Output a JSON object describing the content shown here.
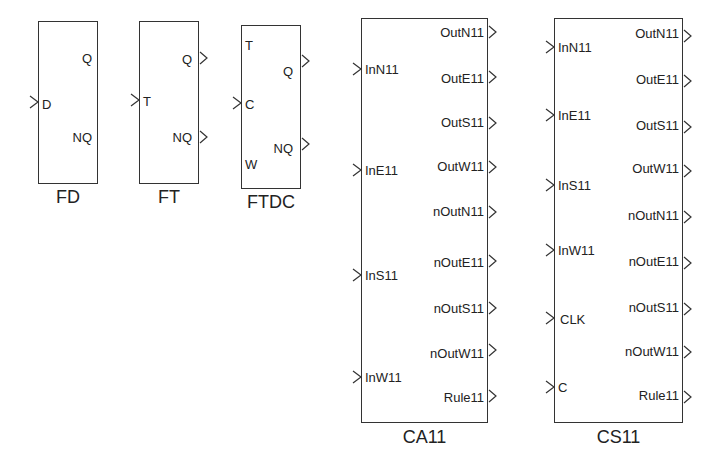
{
  "blocks": {
    "fd": {
      "name": "FD",
      "inputs": [
        {
          "label": "D",
          "arrow": true
        }
      ],
      "outputs": [
        {
          "label": "Q",
          "arrow": false
        },
        {
          "label": "NQ",
          "arrow": false
        }
      ]
    },
    "ft": {
      "name": "FT",
      "inputs": [
        {
          "label": "T",
          "arrow": true
        }
      ],
      "outputs": [
        {
          "label": "Q",
          "arrow": true
        },
        {
          "label": "NQ",
          "arrow": true
        }
      ]
    },
    "ftdc": {
      "name": "FTDC",
      "inputs": [
        {
          "label": "T",
          "arrow": false
        },
        {
          "label": "C",
          "arrow": true
        },
        {
          "label": "W",
          "arrow": false
        }
      ],
      "outputs": [
        {
          "label": "Q",
          "arrow": true
        },
        {
          "label": "NQ",
          "arrow": true
        }
      ]
    },
    "ca11": {
      "name": "CA11",
      "inputs": [
        {
          "label": "InN11"
        },
        {
          "label": "InE11"
        },
        {
          "label": "InS11"
        },
        {
          "label": "InW11"
        }
      ],
      "outputs": [
        {
          "label": "OutN11"
        },
        {
          "label": "OutE11"
        },
        {
          "label": "OutS11"
        },
        {
          "label": "OutW11"
        },
        {
          "label": "nOutN11"
        },
        {
          "label": "nOutE11"
        },
        {
          "label": "nOutS11"
        },
        {
          "label": "nOutW11"
        },
        {
          "label": "Rule11"
        }
      ]
    },
    "cs11": {
      "name": "CS11",
      "inputs": [
        {
          "label": "InN11"
        },
        {
          "label": "InE11"
        },
        {
          "label": "InS11"
        },
        {
          "label": "InW11"
        },
        {
          "label": "CLK"
        },
        {
          "label": "C"
        }
      ],
      "outputs": [
        {
          "label": "OutN11"
        },
        {
          "label": "OutE11"
        },
        {
          "label": "OutS11"
        },
        {
          "label": "OutW11"
        },
        {
          "label": "nOutN11"
        },
        {
          "label": "nOutE11"
        },
        {
          "label": "nOutS11"
        },
        {
          "label": "nOutW11"
        },
        {
          "label": "Rule11"
        }
      ]
    }
  },
  "colors": {
    "line": "#333333",
    "text": "#222222",
    "background": "#ffffff"
  }
}
